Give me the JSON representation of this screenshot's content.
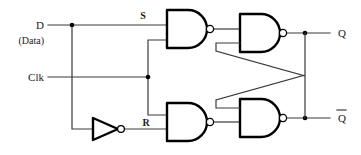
{
  "diagram": {
    "width": 361,
    "height": 155,
    "background": "#ffffff",
    "wire_color": "#3a3a3a",
    "gate_color": "#000000"
  },
  "labels": {
    "d_input": "D",
    "d_input_sub": "(Data)",
    "clk_input": "Clk",
    "s_signal": "S",
    "r_signal": "R",
    "q_output": "Q",
    "qbar_output": "Q"
  },
  "gates": [
    {
      "name": "nand-s",
      "type": "NAND",
      "inputs": 2,
      "output": "S"
    },
    {
      "name": "nand-r",
      "type": "NAND",
      "inputs": 2,
      "output": "R"
    },
    {
      "name": "nand-q",
      "type": "NAND",
      "inputs": 2,
      "output": "Q"
    },
    {
      "name": "nand-qbar",
      "type": "NAND",
      "inputs": 2,
      "output": "Qbar"
    },
    {
      "name": "inverter-d",
      "type": "NOT",
      "inputs": 1,
      "output": "Dbar"
    }
  ],
  "nets": [
    {
      "from": "D",
      "to": "nand-s.in1"
    },
    {
      "from": "D",
      "to": "inverter-d.in"
    },
    {
      "from": "Clk",
      "to": "nand-s.in2"
    },
    {
      "from": "Clk",
      "to": "nand-r.in1"
    },
    {
      "from": "inverter-d.out",
      "to": "nand-r.in2"
    },
    {
      "from": "nand-s.out",
      "to": "nand-q.in1"
    },
    {
      "from": "nand-r.out",
      "to": "nand-qbar.in2"
    },
    {
      "from": "nand-q.out",
      "to": "nand-qbar.in1"
    },
    {
      "from": "nand-qbar.out",
      "to": "nand-q.in2"
    },
    {
      "from": "nand-q.out",
      "to": "Q"
    },
    {
      "from": "nand-qbar.out",
      "to": "Qbar"
    }
  ]
}
